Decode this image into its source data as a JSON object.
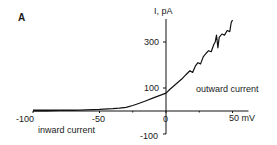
{
  "panel_label": "A",
  "chart_data": {
    "type": "line",
    "title": "",
    "xlabel": "mV",
    "ylabel": "I, pA",
    "xlim": [
      -100,
      62
    ],
    "ylim": [
      -100,
      420
    ],
    "x_ticks": [
      -100,
      -50,
      0,
      50
    ],
    "x_tick_labels": [
      "-100",
      "-50",
      "0",
      "50 mV"
    ],
    "y_ticks": [
      -100,
      100,
      300
    ],
    "y_tick_labels": [
      "-100",
      "100",
      "300"
    ],
    "grid": false,
    "legend": null,
    "annotations": [
      "inward current",
      "outward current"
    ],
    "series": [
      {
        "name": "I-V relation",
        "x": [
          -100,
          -90,
          -80,
          -70,
          -60,
          -50,
          -40,
          -35,
          -30,
          -25,
          -20,
          -15,
          -10,
          -5,
          0,
          3,
          6,
          9,
          12,
          15,
          18,
          20,
          22,
          24,
          26,
          28,
          30,
          32,
          34,
          36,
          37,
          38,
          39,
          40,
          42,
          44,
          46,
          48,
          49,
          50
        ],
        "y": [
          0,
          0,
          2,
          3,
          5,
          7,
          10,
          12,
          16,
          24,
          34,
          45,
          56,
          67,
          78,
          95,
          110,
          125,
          140,
          158,
          175,
          168,
          195,
          210,
          205,
          235,
          250,
          262,
          258,
          290,
          300,
          330,
          275,
          320,
          335,
          330,
          350,
          345,
          385,
          395
        ]
      }
    ]
  },
  "labels": {
    "y_axis_title": "I, pA",
    "y_tick_300": "300",
    "y_tick_100": "100",
    "y_tick_neg100": "-100",
    "x_tick_neg100": "-100",
    "x_tick_neg50": "-50",
    "x_tick_0": "0",
    "x_tick_50": "50 mV",
    "inward": "inward current",
    "outward": "outward current"
  }
}
